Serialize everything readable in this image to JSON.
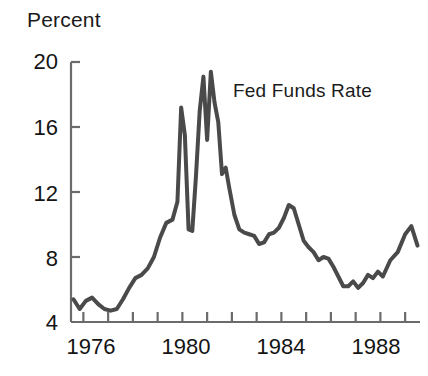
{
  "chart_data": {
    "type": "line",
    "title": "",
    "xlabel": "",
    "ylabel": "Percent",
    "ylim": [
      4,
      20
    ],
    "xlim": [
      1975.5,
      1989.6
    ],
    "yticks": [
      4,
      8,
      12,
      16,
      20
    ],
    "xticks": [
      1976,
      1977,
      1978,
      1979,
      1980,
      1981,
      1982,
      1983,
      1984,
      1985,
      1986,
      1987,
      1988,
      1989
    ],
    "xtick_labels_shown": [
      "1976",
      "1980",
      "1984",
      "1988"
    ],
    "ytick_labels_shown": [
      "20",
      "16",
      "12",
      "8",
      "4"
    ],
    "grid": false,
    "legend": "none",
    "annotations": [
      {
        "text": "Fed Funds Rate",
        "x": 1981.4,
        "y": 17.4
      }
    ],
    "series": [
      {
        "name": "Fed Funds Rate",
        "color": "#4a4a4a",
        "line_width": 4,
        "x": [
          1975.6,
          1975.85,
          1976.1,
          1976.35,
          1976.6,
          1976.85,
          1977.1,
          1977.35,
          1977.6,
          1977.85,
          1978.1,
          1978.35,
          1978.6,
          1978.85,
          1979.1,
          1979.35,
          1979.6,
          1979.8,
          1979.95,
          1980.1,
          1980.25,
          1980.4,
          1980.55,
          1980.7,
          1980.85,
          1981.0,
          1981.15,
          1981.3,
          1981.45,
          1981.6,
          1981.75,
          1981.9,
          1982.1,
          1982.3,
          1982.5,
          1982.7,
          1982.9,
          1983.1,
          1983.3,
          1983.5,
          1983.7,
          1983.9,
          1984.1,
          1984.3,
          1984.5,
          1984.7,
          1984.9,
          1985.1,
          1985.3,
          1985.5,
          1985.7,
          1985.9,
          1986.1,
          1986.3,
          1986.5,
          1986.7,
          1986.9,
          1987.1,
          1987.3,
          1987.5,
          1987.7,
          1987.9,
          1988.1,
          1988.4,
          1988.7,
          1989.0,
          1989.25,
          1989.5
        ],
        "y": [
          5.4,
          4.8,
          5.3,
          5.5,
          5.1,
          4.8,
          4.7,
          4.8,
          5.4,
          6.1,
          6.7,
          6.9,
          7.3,
          8.0,
          9.2,
          10.1,
          10.3,
          11.4,
          17.2,
          15.5,
          9.7,
          9.6,
          13.0,
          17.0,
          19.1,
          15.2,
          19.4,
          17.5,
          16.3,
          13.1,
          13.5,
          12.2,
          10.6,
          9.7,
          9.5,
          9.4,
          9.3,
          8.8,
          8.9,
          9.4,
          9.5,
          9.8,
          10.4,
          11.2,
          11.0,
          10.0,
          9.0,
          8.6,
          8.3,
          7.8,
          8.0,
          7.9,
          7.4,
          6.8,
          6.2,
          6.2,
          6.5,
          6.1,
          6.4,
          6.9,
          6.7,
          7.1,
          6.8,
          7.8,
          8.3,
          9.4,
          9.9,
          8.7
        ]
      }
    ]
  },
  "axes": {
    "y_title": "Percent",
    "y_labels": [
      {
        "value": "20"
      },
      {
        "value": "16"
      },
      {
        "value": "12"
      },
      {
        "value": "8"
      },
      {
        "value": "4"
      }
    ],
    "x_labels": [
      {
        "value": "1976"
      },
      {
        "value": "1980"
      },
      {
        "value": "1984"
      },
      {
        "value": "1988"
      }
    ]
  },
  "colors": {
    "line": "#4a4a4a",
    "axis": "#6b6b6b",
    "text": "#141414",
    "background": "#ffffff"
  }
}
